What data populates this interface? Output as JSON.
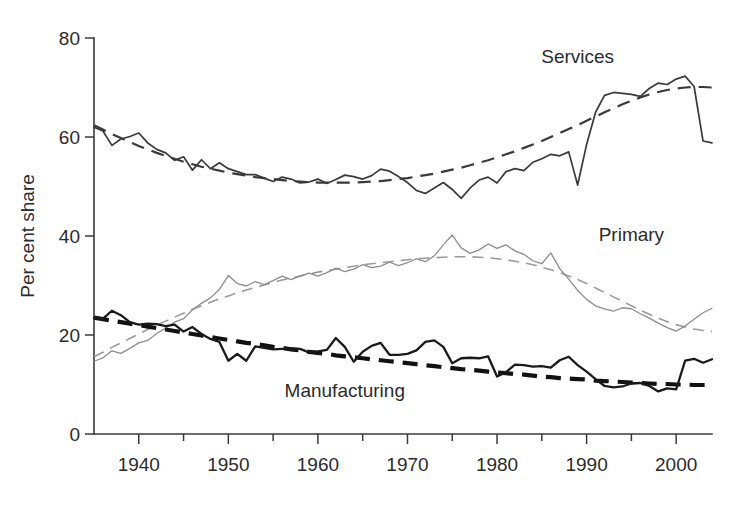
{
  "chart_data": {
    "type": "line",
    "title": "",
    "xlabel": "",
    "ylabel": "Per cent share",
    "xlim": [
      1935,
      2004
    ],
    "ylim": [
      0,
      80
    ],
    "yticks": [
      0,
      20,
      40,
      60,
      80
    ],
    "xticks": [
      1940,
      1950,
      1960,
      1970,
      1980,
      1990,
      2000
    ],
    "xticks_minor": [
      1935,
      1945,
      1955,
      1965,
      1975,
      1985,
      1995
    ],
    "grid": false,
    "legend_position": "inline-annotations",
    "annotations": [
      {
        "text": "Services",
        "x": 1989,
        "y": 75
      },
      {
        "text": "Primary",
        "x": 1995,
        "y": 39
      },
      {
        "text": "Manufacturing",
        "x": 1963,
        "y": 7.5
      }
    ],
    "colors": {
      "services": "#3a3a3a",
      "manufacturing": "#1a1a1a",
      "primary": "#8d8d8d",
      "axis": "#3a3a3a",
      "text": "#2b2b2b",
      "background": "#ffffff"
    },
    "x": [
      1935,
      1936,
      1937,
      1938,
      1939,
      1940,
      1941,
      1942,
      1943,
      1944,
      1945,
      1946,
      1947,
      1948,
      1949,
      1950,
      1951,
      1952,
      1953,
      1954,
      1955,
      1956,
      1957,
      1958,
      1959,
      1960,
      1961,
      1962,
      1963,
      1964,
      1965,
      1966,
      1967,
      1968,
      1969,
      1970,
      1971,
      1972,
      1973,
      1974,
      1975,
      1976,
      1977,
      1978,
      1979,
      1980,
      1981,
      1982,
      1983,
      1984,
      1985,
      1986,
      1987,
      1988,
      1989,
      1990,
      1991,
      1992,
      1993,
      1994,
      1995,
      1996,
      1997,
      1998,
      1999,
      2000,
      2001,
      2002,
      2003,
      2004
    ],
    "series": [
      {
        "name": "Services",
        "style": "solid",
        "color": "#3a3a3a",
        "values": [
          62.0,
          61.2,
          58.3,
          59.6,
          60.1,
          60.8,
          58.8,
          57.5,
          56.8,
          55.3,
          56.0,
          53.3,
          55.4,
          53.6,
          54.8,
          53.6,
          53.0,
          52.4,
          52.4,
          51.7,
          51.0,
          51.9,
          51.5,
          50.7,
          50.9,
          51.5,
          50.6,
          51.4,
          52.3,
          52.0,
          51.5,
          52.2,
          53.5,
          53.1,
          52.0,
          50.8,
          49.2,
          48.6,
          49.7,
          50.8,
          49.4,
          47.6,
          49.7,
          51.3,
          51.9,
          50.7,
          53.0,
          53.6,
          53.2,
          54.9,
          55.6,
          56.5,
          56.2,
          57.0,
          50.3,
          58.5,
          65.0,
          68.4,
          69.0,
          68.8,
          68.6,
          68.2,
          69.8,
          70.9,
          70.6,
          71.7,
          72.3,
          70.2,
          59.2,
          58.8
        ]
      },
      {
        "name": "Services trend",
        "style": "dashed",
        "color": "#3a3a3a",
        "values": [
          62.4,
          61.5,
          60.6,
          59.8,
          59.0,
          58.2,
          57.5,
          56.8,
          56.2,
          55.6,
          55.0,
          54.5,
          54.0,
          53.6,
          53.2,
          52.8,
          52.5,
          52.2,
          51.9,
          51.7,
          51.5,
          51.3,
          51.1,
          51.0,
          50.9,
          50.8,
          50.8,
          50.8,
          50.8,
          50.8,
          50.9,
          51.0,
          51.1,
          51.3,
          51.5,
          51.7,
          52.0,
          52.3,
          52.6,
          53.0,
          53.4,
          53.8,
          54.3,
          54.8,
          55.3,
          55.9,
          56.5,
          57.1,
          57.8,
          58.5,
          59.2,
          60.0,
          60.8,
          61.6,
          62.4,
          63.3,
          64.1,
          65.0,
          65.8,
          66.6,
          67.3,
          68.0,
          68.6,
          69.1,
          69.5,
          69.8,
          70.0,
          70.1,
          70.1,
          70.0
        ]
      },
      {
        "name": "Primary",
        "style": "solid",
        "color": "#8d8d8d",
        "values": [
          14.7,
          15.4,
          16.8,
          16.3,
          17.3,
          18.4,
          18.9,
          20.3,
          21.4,
          22.6,
          23.3,
          25.1,
          26.4,
          27.5,
          29.2,
          32.0,
          30.4,
          29.9,
          30.8,
          30.2,
          31.0,
          31.9,
          31.2,
          31.9,
          32.5,
          31.9,
          32.6,
          33.5,
          32.8,
          33.3,
          34.2,
          33.6,
          33.9,
          34.7,
          34.0,
          34.6,
          35.4,
          34.8,
          36.0,
          38.2,
          40.2,
          37.6,
          36.5,
          37.2,
          38.4,
          37.5,
          38.2,
          37.0,
          36.3,
          35.0,
          34.4,
          36.6,
          33.4,
          31.3,
          29.0,
          27.2,
          25.9,
          25.3,
          24.8,
          25.5,
          25.3,
          24.3,
          23.4,
          22.4,
          21.5,
          20.8,
          21.8,
          23.2,
          24.5,
          25.4
        ]
      },
      {
        "name": "Primary trend",
        "style": "dashed",
        "color": "#9a9a9a",
        "values": [
          15.6,
          16.5,
          17.5,
          18.4,
          19.3,
          20.2,
          21.1,
          22.0,
          22.8,
          23.6,
          24.4,
          25.2,
          25.9,
          26.6,
          27.3,
          27.9,
          28.5,
          29.1,
          29.6,
          30.1,
          30.6,
          31.1,
          31.5,
          31.9,
          32.3,
          32.7,
          33.0,
          33.3,
          33.6,
          33.9,
          34.2,
          34.4,
          34.6,
          34.8,
          35.0,
          35.2,
          35.4,
          35.5,
          35.6,
          35.7,
          35.8,
          35.8,
          35.8,
          35.7,
          35.6,
          35.4,
          35.2,
          34.9,
          34.6,
          34.2,
          33.7,
          33.2,
          32.6,
          31.9,
          31.2,
          30.4,
          29.5,
          28.6,
          27.7,
          26.8,
          25.9,
          25.0,
          24.2,
          23.4,
          22.7,
          22.1,
          21.6,
          21.2,
          20.9,
          20.7
        ]
      },
      {
        "name": "Manufacturing",
        "style": "solid",
        "color": "#1a1a1a",
        "values": [
          23.4,
          23.3,
          24.9,
          24.0,
          22.6,
          22.1,
          22.3,
          22.2,
          21.8,
          22.1,
          20.7,
          21.6,
          20.2,
          19.2,
          18.6,
          14.8,
          16.2,
          14.8,
          17.7,
          17.4,
          17.1,
          17.2,
          17.3,
          17.2,
          16.5,
          16.7,
          17.0,
          19.4,
          17.6,
          14.6,
          16.6,
          17.8,
          18.4,
          16.0,
          16.0,
          16.2,
          16.9,
          18.6,
          18.9,
          17.6,
          14.3,
          15.3,
          15.4,
          15.3,
          15.7,
          11.6,
          12.5,
          14.0,
          13.9,
          13.6,
          13.7,
          13.4,
          14.9,
          15.6,
          13.9,
          12.6,
          11.1,
          9.7,
          9.4,
          9.6,
          10.2,
          10.3,
          9.7,
          8.6,
          9.2,
          9.0,
          14.8,
          15.2,
          14.4,
          15.1
        ]
      },
      {
        "name": "Manufacturing trend",
        "style": "dashed",
        "color": "#111111",
        "values": [
          23.5,
          23.2,
          22.9,
          22.6,
          22.3,
          22.0,
          21.7,
          21.4,
          21.1,
          20.8,
          20.5,
          20.2,
          19.9,
          19.6,
          19.3,
          19.0,
          18.7,
          18.4,
          18.2,
          17.9,
          17.6,
          17.4,
          17.1,
          16.9,
          16.6,
          16.4,
          16.2,
          15.9,
          15.7,
          15.5,
          15.3,
          15.1,
          14.9,
          14.7,
          14.5,
          14.3,
          14.1,
          13.9,
          13.7,
          13.5,
          13.3,
          13.1,
          13.0,
          12.8,
          12.6,
          12.4,
          12.3,
          12.1,
          12.0,
          11.8,
          11.6,
          11.5,
          11.3,
          11.2,
          11.1,
          11.0,
          10.8,
          10.7,
          10.6,
          10.5,
          10.4,
          10.3,
          10.2,
          10.1,
          10.1,
          10.0,
          10.0,
          9.9,
          9.9,
          9.9
        ]
      }
    ]
  },
  "axes": {
    "y_axis_title": "Per cent share",
    "y_tick_labels": [
      "0",
      "20",
      "40",
      "60",
      "80"
    ],
    "x_tick_labels": [
      "1940",
      "1950",
      "1960",
      "1970",
      "1980",
      "1990",
      "2000"
    ]
  },
  "labels": {
    "services": "Services",
    "primary": "Primary",
    "manufacturing": "Manufacturing"
  }
}
